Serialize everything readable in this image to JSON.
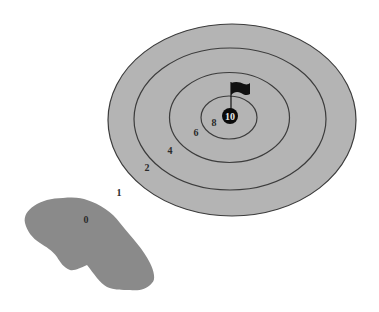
{
  "diagram": {
    "type": "golf-target-scoring",
    "colors": {
      "background": "#ffffff",
      "green": "#b4b4b4",
      "ring_line": "#3c3c3c",
      "bunker": "#8a8a8a",
      "hole": "#0a0a0a",
      "flag": "#111111"
    },
    "rings": [
      {
        "name": "outer-ring",
        "cx": 232,
        "cy": 120,
        "rx": 124,
        "ry": 96
      },
      {
        "name": "ring-2",
        "cx": 230,
        "cy": 119,
        "rx": 96,
        "ry": 71
      },
      {
        "name": "ring-3",
        "cx": 229.5,
        "cy": 117.5,
        "rx": 60,
        "ry": 45
      },
      {
        "name": "ring-4",
        "cx": 229,
        "cy": 117.5,
        "rx": 28,
        "ry": 21.5
      }
    ],
    "hole": {
      "cx": 230,
      "cy": 116,
      "r": 8,
      "label": "10"
    },
    "scores": [
      {
        "value": "8",
        "x": 214,
        "y": 126
      },
      {
        "value": "6",
        "x": 196,
        "y": 136
      },
      {
        "value": "4",
        "x": 170,
        "y": 154
      },
      {
        "value": "2",
        "x": 147,
        "y": 171
      },
      {
        "value": "1",
        "x": 119,
        "y": 196
      },
      {
        "value": "0",
        "x": 86,
        "y": 223
      }
    ]
  }
}
